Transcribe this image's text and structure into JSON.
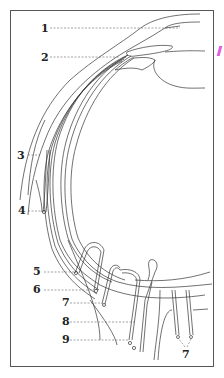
{
  "figure": {
    "type": "anatomical line drawing",
    "frame_color": "#555555",
    "line_color": "#333333",
    "labels": [
      {
        "id": "1",
        "text": "1",
        "x": 41,
        "y": 23
      },
      {
        "id": "2",
        "text": "2",
        "x": 41,
        "y": 52
      },
      {
        "id": "3",
        "text": "3",
        "x": 17,
        "y": 150
      },
      {
        "id": "4",
        "text": "4",
        "x": 18,
        "y": 205
      },
      {
        "id": "5",
        "text": "5",
        "x": 33,
        "y": 266
      },
      {
        "id": "6",
        "text": "6",
        "x": 33,
        "y": 284
      },
      {
        "id": "7a",
        "text": "7",
        "x": 62,
        "y": 297
      },
      {
        "id": "8",
        "text": "8",
        "x": 62,
        "y": 316
      },
      {
        "id": "9",
        "text": "9",
        "x": 62,
        "y": 334
      },
      {
        "id": "7b",
        "text": "7",
        "x": 182,
        "y": 349
      }
    ]
  }
}
